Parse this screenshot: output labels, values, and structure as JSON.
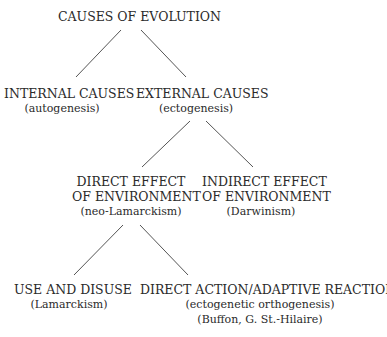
{
  "diagram": {
    "root": {
      "title": "CAUSES OF EVOLUTION"
    },
    "internal": {
      "title": "INTERNAL CAUSES",
      "subtitle": "(autogenesis)"
    },
    "external": {
      "title": "EXTERNAL CAUSES",
      "subtitle": "(ectogenesis)"
    },
    "direct_effect": {
      "title_line1": "DIRECT EFFECT",
      "title_line2": "OF ENVIRONMENT",
      "subtitle": "(neo-Lamarckism)"
    },
    "indirect_effect": {
      "title_line1": "INDIRECT EFFECT",
      "title_line2": "OF ENVIRONMENT",
      "subtitle": "(Darwinism)"
    },
    "use_disuse": {
      "title": "USE AND DISUSE",
      "subtitle": "(Lamarckism)"
    },
    "direct_action": {
      "title": "DIRECT ACTION/ADAPTIVE REACTION",
      "subtitle1": "(ectogenetic orthogenesis)",
      "subtitle2": "(Buffon, G. St.-Hilaire)"
    },
    "edges": [
      [
        "CAUSES OF EVOLUTION",
        "INTERNAL CAUSES"
      ],
      [
        "CAUSES OF EVOLUTION",
        "EXTERNAL CAUSES"
      ],
      [
        "EXTERNAL CAUSES",
        "DIRECT EFFECT OF ENVIRONMENT"
      ],
      [
        "EXTERNAL CAUSES",
        "INDIRECT EFFECT OF ENVIRONMENT"
      ],
      [
        "DIRECT EFFECT OF ENVIRONMENT",
        "USE AND DISUSE"
      ],
      [
        "DIRECT EFFECT OF ENVIRONMENT",
        "DIRECT ACTION/ADAPTIVE REACTION"
      ]
    ]
  }
}
